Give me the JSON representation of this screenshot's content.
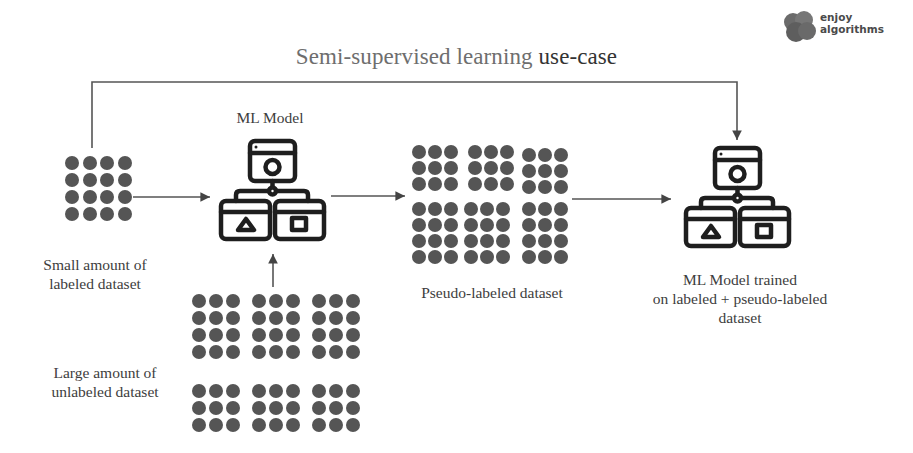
{
  "title": {
    "part1": "Semi-supervised learning",
    "part2": "use-case"
  },
  "logo": {
    "line1": "enjoy",
    "line2": "algorithms",
    "icon": "brain-blob-icon"
  },
  "nodes": {
    "labeled_dataset": {
      "label_line1": "Small amount of",
      "label_line2": "labeled dataset",
      "dots": {
        "rows": 4,
        "cols": 4
      }
    },
    "ml_model": {
      "label": "ML Model",
      "icon": "ml-model-hierarchy-icon"
    },
    "unlabeled_dataset": {
      "label_line1": "Large amount of",
      "label_line2": "unlabeled dataset",
      "dots": {
        "blocks": 6,
        "rows_top": 4,
        "rows_bottom": 3,
        "cols": 3
      }
    },
    "pseudo_labeled_dataset": {
      "label": "Pseudo-labeled dataset",
      "dots": {
        "blocks": 6,
        "rows_top": 3,
        "rows_bottom": 4,
        "cols": 3
      }
    },
    "ml_model_trained": {
      "label_line1": "ML Model trained",
      "label_line2": "on labeled + pseudo-labeled",
      "label_line3": "dataset",
      "icon": "ml-model-hierarchy-icon"
    }
  },
  "edges": [
    {
      "from": "labeled_dataset",
      "to": "ml_model"
    },
    {
      "from": "unlabeled_dataset",
      "to": "ml_model"
    },
    {
      "from": "ml_model",
      "to": "pseudo_labeled_dataset"
    },
    {
      "from": "pseudo_labeled_dataset",
      "to": "ml_model_trained"
    },
    {
      "from": "labeled_dataset",
      "to": "ml_model_trained",
      "route": "top-bypass"
    }
  ],
  "colors": {
    "dot": "#555555",
    "line": "#444444",
    "icon": "#1e1e1e",
    "title": "#6e6e6e"
  }
}
